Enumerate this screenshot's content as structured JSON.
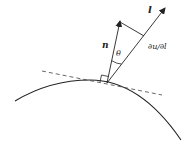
{
  "diagram": {
    "labels": {
      "direction_vector": "l",
      "normal_vector": "n",
      "angle": "θ",
      "derivative": "∂u/∂l"
    },
    "colors": {
      "stroke": "#222222",
      "background": "#ffffff"
    },
    "elements": [
      {
        "id": "boundary-curve",
        "type": "curve",
        "style": "solid"
      },
      {
        "id": "tangent-line",
        "type": "line",
        "style": "dashed"
      },
      {
        "id": "normal-vector",
        "type": "arrow",
        "label": "n"
      },
      {
        "id": "direction-vector",
        "type": "arrow",
        "label": "l"
      },
      {
        "id": "projection-line",
        "type": "line",
        "style": "solid"
      },
      {
        "id": "angle-arc",
        "type": "arc",
        "label": "θ"
      },
      {
        "id": "right-angle-marker",
        "type": "square"
      }
    ]
  }
}
